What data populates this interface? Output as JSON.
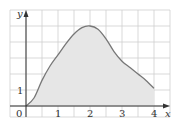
{
  "chart_data": {
    "type": "area",
    "title": "",
    "xlabel": "x",
    "ylabel": "y",
    "x_ticks": [
      "0",
      "1",
      "2",
      "3",
      "4"
    ],
    "y_ticks": [
      "1"
    ],
    "xlim": [
      -0.5,
      4.5
    ],
    "ylim": [
      -0.7,
      6
    ],
    "grid": true,
    "grid_step_x": 0.5,
    "grid_step_y": 1,
    "series": [
      {
        "name": "f(x)",
        "x": [
          0,
          0.25,
          0.5,
          0.75,
          1,
          1.25,
          1.5,
          1.75,
          2,
          2.25,
          2.5,
          2.75,
          3,
          3.25,
          3.5,
          3.75,
          4
        ],
        "y": [
          0,
          0.5,
          1.6,
          2.5,
          3.2,
          3.9,
          4.5,
          4.9,
          5.0,
          4.8,
          4.2,
          3.4,
          2.8,
          2.4,
          2.0,
          1.6,
          1.1
        ],
        "fill_to_zero": true
      }
    ]
  },
  "labels": {
    "origin": "0",
    "x_axis": "x",
    "y_axis": "y",
    "x1": "1",
    "x2": "2",
    "x3": "3",
    "x4": "4",
    "y1": "1"
  },
  "colors": {
    "curve": "#777777",
    "fill": "#e6e6e6",
    "grid": "#cfcfcf",
    "axis": "#333333"
  }
}
